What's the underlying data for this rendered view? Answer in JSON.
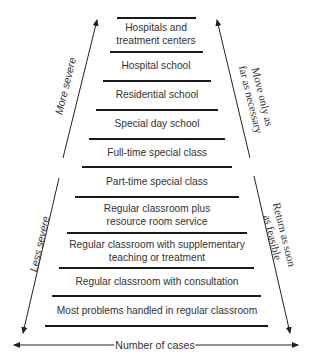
{
  "diagram": {
    "type": "cascade-of-services",
    "tiers": [
      {
        "label_line1": "Hospitals and",
        "label_line2": "treatment centers"
      },
      {
        "label_line1": "Hospital school",
        "label_line2": ""
      },
      {
        "label_line1": "Residential school",
        "label_line2": ""
      },
      {
        "label_line1": "Special day school",
        "label_line2": ""
      },
      {
        "label_line1": "Full-time special class",
        "label_line2": ""
      },
      {
        "label_line1": "Part-time special class",
        "label_line2": ""
      },
      {
        "label_line1": "Regular classroom plus",
        "label_line2": "resource room service"
      },
      {
        "label_line1": "Regular classroom with supplementary",
        "label_line2": "teaching or treatment"
      },
      {
        "label_line1": "Regular classroom with consultation",
        "label_line2": ""
      },
      {
        "label_line1": "Most problems handled in regular classroom",
        "label_line2": ""
      }
    ],
    "left_arrows": {
      "upper": "More severe",
      "lower": "Less severe"
    },
    "right_arrows": {
      "upper_line1": "Move only as",
      "upper_line2": "far as necessary",
      "lower_line1": "Return as soon",
      "lower_line2": "as feasible"
    },
    "bottom_axis": "Number of cases"
  }
}
